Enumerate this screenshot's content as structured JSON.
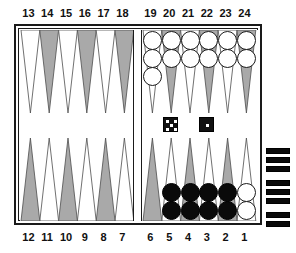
{
  "app": {
    "title": "Backgammon Board Position",
    "board_type": "backgammon"
  },
  "labels": {
    "top_left": [
      "13",
      "14",
      "15",
      "16",
      "17",
      "18"
    ],
    "top_right": [
      "19",
      "20",
      "21",
      "22",
      "23",
      "24"
    ],
    "bottom_left": [
      "12",
      "11",
      "10",
      "9",
      "8",
      "7"
    ],
    "bottom_right": [
      "6",
      "5",
      "4",
      "3",
      "2",
      "1"
    ]
  },
  "colors": {
    "board_background": "#ffffff",
    "point_light": "#ffffff",
    "point_dark": "#a9a9a9",
    "frame": "#1a1a1a",
    "checker_white": "#ffffff",
    "checker_black": "#0a0a0a",
    "die_face": "#111111",
    "die_pip": "#ffffff",
    "tray_bar": "#0a0a0a"
  },
  "points": [
    {
      "number": "1",
      "quadrant": "bottom-right",
      "slot": 5,
      "shade": "light",
      "checker_color": "white",
      "count": 2
    },
    {
      "number": "2",
      "quadrant": "bottom-right",
      "slot": 4,
      "shade": "dark",
      "checker_color": "black",
      "count": 2
    },
    {
      "number": "3",
      "quadrant": "bottom-right",
      "slot": 3,
      "shade": "light",
      "checker_color": "black",
      "count": 2
    },
    {
      "number": "4",
      "quadrant": "bottom-right",
      "slot": 2,
      "shade": "dark",
      "checker_color": "black",
      "count": 2
    },
    {
      "number": "5",
      "quadrant": "bottom-right",
      "slot": 1,
      "shade": "light",
      "checker_color": "black",
      "count": 2
    },
    {
      "number": "6",
      "quadrant": "bottom-right",
      "slot": 0,
      "shade": "dark",
      "checker_color": null,
      "count": 0
    },
    {
      "number": "7",
      "quadrant": "bottom-left",
      "slot": 5,
      "shade": "light",
      "checker_color": null,
      "count": 0
    },
    {
      "number": "8",
      "quadrant": "bottom-left",
      "slot": 4,
      "shade": "dark",
      "checker_color": null,
      "count": 0
    },
    {
      "number": "9",
      "quadrant": "bottom-left",
      "slot": 3,
      "shade": "light",
      "checker_color": null,
      "count": 0
    },
    {
      "number": "10",
      "quadrant": "bottom-left",
      "slot": 2,
      "shade": "dark",
      "checker_color": null,
      "count": 0
    },
    {
      "number": "11",
      "quadrant": "bottom-left",
      "slot": 1,
      "shade": "light",
      "checker_color": null,
      "count": 0
    },
    {
      "number": "12",
      "quadrant": "bottom-left",
      "slot": 0,
      "shade": "dark",
      "checker_color": null,
      "count": 0
    },
    {
      "number": "13",
      "quadrant": "top-left",
      "slot": 0,
      "shade": "light",
      "checker_color": null,
      "count": 0
    },
    {
      "number": "14",
      "quadrant": "top-left",
      "slot": 1,
      "shade": "dark",
      "checker_color": null,
      "count": 0
    },
    {
      "number": "15",
      "quadrant": "top-left",
      "slot": 2,
      "shade": "light",
      "checker_color": null,
      "count": 0
    },
    {
      "number": "16",
      "quadrant": "top-left",
      "slot": 3,
      "shade": "dark",
      "checker_color": null,
      "count": 0
    },
    {
      "number": "17",
      "quadrant": "top-left",
      "slot": 4,
      "shade": "light",
      "checker_color": null,
      "count": 0
    },
    {
      "number": "18",
      "quadrant": "top-left",
      "slot": 5,
      "shade": "dark",
      "checker_color": null,
      "count": 0
    },
    {
      "number": "19",
      "quadrant": "top-right",
      "slot": 0,
      "shade": "light",
      "checker_color": "white",
      "count": 3
    },
    {
      "number": "20",
      "quadrant": "top-right",
      "slot": 1,
      "shade": "dark",
      "checker_color": "white",
      "count": 2
    },
    {
      "number": "21",
      "quadrant": "top-right",
      "slot": 2,
      "shade": "light",
      "checker_color": "white",
      "count": 2
    },
    {
      "number": "22",
      "quadrant": "top-right",
      "slot": 3,
      "shade": "dark",
      "checker_color": "white",
      "count": 2
    },
    {
      "number": "23",
      "quadrant": "top-right",
      "slot": 4,
      "shade": "light",
      "checker_color": "white",
      "count": 2
    },
    {
      "number": "24",
      "quadrant": "top-right",
      "slot": 5,
      "shade": "dark",
      "checker_color": "white",
      "count": 2
    }
  ],
  "dice": [
    {
      "value": 5,
      "x": 163,
      "y": 117
    },
    {
      "value": 1,
      "x": 199,
      "y": 117
    }
  ],
  "tray": {
    "label": "borne-off-tray",
    "bar_count": 8,
    "groups": [
      3,
      3,
      2
    ]
  }
}
